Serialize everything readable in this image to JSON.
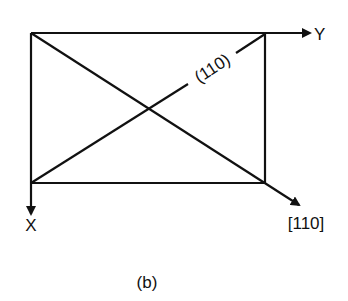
{
  "figure": {
    "caption": "(b)",
    "labels": {
      "y_axis": "Y",
      "x_axis": "X",
      "direction": "[110]",
      "plane": "(110)"
    },
    "colors": {
      "line": "#111111",
      "background": "#ffffff"
    }
  }
}
